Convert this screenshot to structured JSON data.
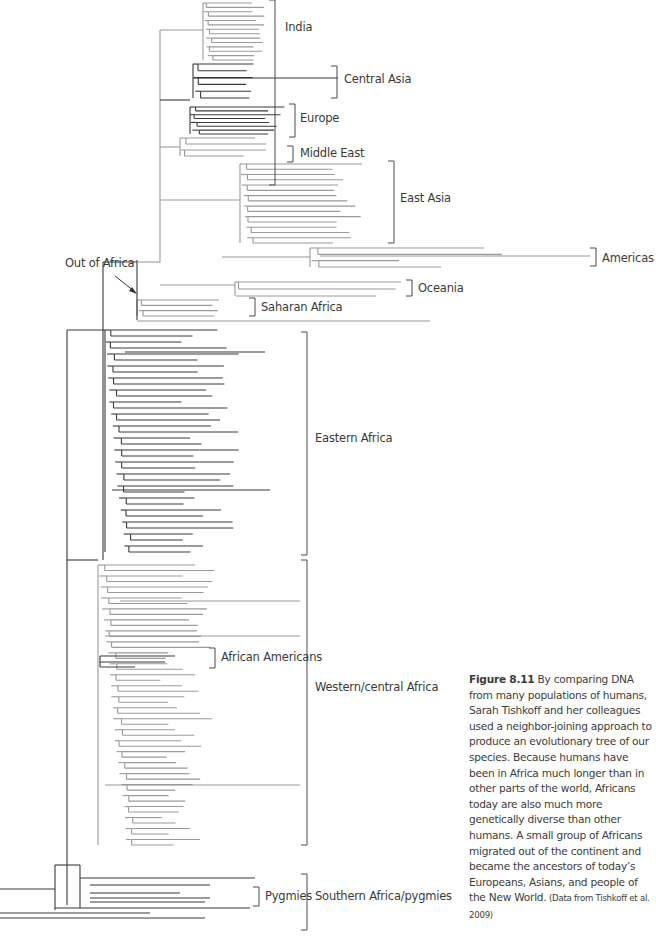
{
  "figure": {
    "number": "Figure 8.11",
    "caption": " By comparing DNA from many populations of humans, Sarah Tishkoff and her colleagues used a neighbor-joining approach to produce an evolutionary tree of our species. Because humans have been in Africa much longer than in other parts of the world, Africans today are also much more genetically diverse than other humans. A small group of Africans migrated out of the continent and became the ancestors of today’s Europeans, Asians, and people of the New World.",
    "source": " (Data from Tishkoff et al. 2009)"
  },
  "annotations": {
    "out_of_africa": "Out of Africa"
  },
  "clades": [
    {
      "name": "India",
      "color": "#8c8c8c",
      "bracket": [
        0,
        185
      ],
      "bracket_x": 275,
      "label_x": 285,
      "label_y": 20
    },
    {
      "name": "Central Asia",
      "color": "#3a3a3a",
      "bracket": [
        66,
        98
      ],
      "bracket_x": 337,
      "label_x": 344,
      "label_y": 72
    },
    {
      "name": "Europe",
      "color": "#3a3a3a",
      "bracket": [
        104,
        137
      ],
      "bracket_x": 295,
      "label_x": 300,
      "label_y": 111
    },
    {
      "name": "Middle East",
      "color": "#8c8c8c",
      "bracket": [
        146,
        162
      ],
      "bracket_x": 293,
      "label_x": 300,
      "label_y": 146
    },
    {
      "name": "East Asia",
      "color": "#8c8c8c",
      "bracket": [
        161,
        243
      ],
      "bracket_x": 394,
      "label_x": 400,
      "label_y": 191
    },
    {
      "name": "Americas",
      "color": "#8c8c8c",
      "bracket": [
        248,
        266
      ],
      "bracket_x": 596,
      "label_x": 602,
      "label_y": 251
    },
    {
      "name": "Oceania",
      "color": "#8c8c8c",
      "bracket": [
        280,
        296
      ],
      "bracket_x": 412,
      "label_x": 418,
      "label_y": 281
    },
    {
      "name": "Saharan Africa",
      "color": "#8c8c8c",
      "bracket": [
        298,
        316
      ],
      "bracket_x": 255,
      "label_x": 261,
      "label_y": 300
    },
    {
      "name": "Eastern Africa",
      "color": "#3a3a3a",
      "bracket": [
        332,
        555
      ],
      "bracket_x": 307,
      "label_x": 315,
      "label_y": 431
    },
    {
      "name": "Western/central Africa",
      "color": "#9a9a9a",
      "bracket": [
        560,
        845
      ],
      "bracket_x": 307,
      "label_x": 315,
      "label_y": 680
    },
    {
      "name": "African Americans",
      "color": "#3a3a3a",
      "bracket": [
        648,
        668
      ],
      "bracket_x": 215,
      "label_x": 221,
      "label_y": 650
    },
    {
      "name": "Pygmies",
      "color": "#3a3a3a",
      "bracket": [
        887,
        906
      ],
      "bracket_x": 259,
      "label_x": 265,
      "label_y": 889
    },
    {
      "name": "Southern Africa/pygmies",
      "color": "#3a3a3a",
      "bracket": [
        874,
        930
      ],
      "bracket_x": 307,
      "label_x": 315,
      "label_y": 889
    }
  ],
  "colors": {
    "dark_branch": "#3a3a3a",
    "light_branch": "#9a9a9a",
    "bracket": "#4a4a4a",
    "text": "#3a3a3a"
  }
}
